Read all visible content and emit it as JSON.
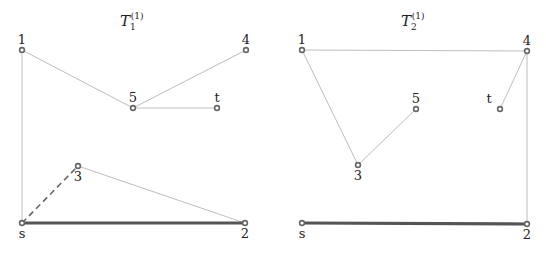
{
  "colors": {
    "thin_edge": "#bdbdbd",
    "thick_edge": "#555555",
    "dashed_edge": "#666666",
    "node_stroke": "#666666",
    "text": "#222222"
  },
  "graphs": [
    {
      "title": {
        "base": "T",
        "subscript": "1",
        "superscript": "(1)"
      },
      "nodes": [
        {
          "id": "1",
          "label": "1",
          "x": 22,
          "y": 50
        },
        {
          "id": "4",
          "label": "4",
          "x": 246,
          "y": 50
        },
        {
          "id": "5",
          "label": "5",
          "x": 133,
          "y": 108
        },
        {
          "id": "t",
          "label": "t",
          "x": 217,
          "y": 108
        },
        {
          "id": "3",
          "label": "3",
          "x": 78,
          "y": 166
        },
        {
          "id": "s",
          "label": "s",
          "x": 22,
          "y": 223
        },
        {
          "id": "2",
          "label": "2",
          "x": 245,
          "y": 223
        }
      ],
      "edges": [
        {
          "from": "1",
          "to": "5",
          "style": "thin"
        },
        {
          "from": "5",
          "to": "4",
          "style": "thin"
        },
        {
          "from": "5",
          "to": "t",
          "style": "thin"
        },
        {
          "from": "1",
          "to": "s",
          "style": "thin"
        },
        {
          "from": "3",
          "to": "2",
          "style": "thin"
        },
        {
          "from": "s",
          "to": "3",
          "style": "dashed"
        },
        {
          "from": "s",
          "to": "2",
          "style": "thick"
        }
      ]
    },
    {
      "title": {
        "base": "T",
        "subscript": "2",
        "superscript": "(1)"
      },
      "nodes": [
        {
          "id": "1",
          "label": "1",
          "x": 302,
          "y": 50
        },
        {
          "id": "4",
          "label": "4",
          "x": 527,
          "y": 51
        },
        {
          "id": "5",
          "label": "5",
          "x": 416,
          "y": 109
        },
        {
          "id": "t",
          "label": "t",
          "x": 500,
          "y": 109
        },
        {
          "id": "3",
          "label": "3",
          "x": 358,
          "y": 165
        },
        {
          "id": "s",
          "label": "s",
          "x": 302,
          "y": 223
        },
        {
          "id": "2",
          "label": "2",
          "x": 527,
          "y": 224
        }
      ],
      "edges": [
        {
          "from": "1",
          "to": "4",
          "style": "thin"
        },
        {
          "from": "1",
          "to": "3",
          "style": "thin"
        },
        {
          "from": "3",
          "to": "5",
          "style": "thin"
        },
        {
          "from": "4",
          "to": "t",
          "style": "thin"
        },
        {
          "from": "4",
          "to": "2",
          "style": "thin"
        },
        {
          "from": "s",
          "to": "2",
          "style": "thick"
        }
      ]
    }
  ]
}
